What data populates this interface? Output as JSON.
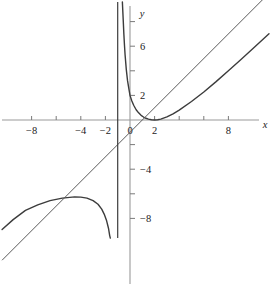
{
  "chart_data": {
    "type": "line",
    "title": "",
    "subtitle": "",
    "xlabel": "x",
    "ylabel": "y",
    "xlim": [
      -10.4,
      11.5
    ],
    "ylim": [
      -9.6,
      9.6
    ],
    "grid": false,
    "legend_position": "none",
    "x_ticks": [
      -10,
      -9,
      -8,
      -7,
      -6,
      -5,
      -4,
      -3,
      -2,
      -1,
      0,
      1,
      2,
      3,
      4,
      5,
      6,
      7,
      8,
      9,
      10
    ],
    "x_tick_labels": [
      {
        "value": -8,
        "label": "−8"
      },
      {
        "value": -4,
        "label": "−4"
      },
      {
        "value": -2,
        "label": "−2"
      },
      {
        "value": 0,
        "label": "0"
      },
      {
        "value": 2,
        "label": "2"
      },
      {
        "value": 8,
        "label": "8"
      }
    ],
    "x_major_ticks": [
      -8,
      -6,
      -4,
      -2,
      2,
      4,
      6,
      8
    ],
    "y_ticks": [
      -9,
      -8,
      -7,
      -6,
      -5,
      -4,
      -3,
      -2,
      -1,
      1,
      2,
      3,
      4,
      5,
      6,
      7,
      8
    ],
    "y_tick_labels": [
      {
        "value": 6,
        "label": "6"
      },
      {
        "value": 2,
        "label": "2"
      },
      {
        "value": -4,
        "label": "−4"
      },
      {
        "value": -8,
        "label": "−8"
      }
    ],
    "y_major_ticks": [
      2,
      4,
      6,
      8,
      -2,
      -4,
      -6,
      -8
    ],
    "series": [
      {
        "name": "curve",
        "kind": "rational-function",
        "description": "Rational curve with vertical asymptote at x = -1 and slant asymptote y = x - 1; right branch minimum near (2, 0), left branch maximum near (-4, -6.3)",
        "vertical_asymptote": -1,
        "slant_asymptote": {
          "slope": 1,
          "intercept": -1
        },
        "color": "#3c3c3c",
        "width": 1.4,
        "points_right_branch": [
          [
            -0.62,
            9.6
          ],
          [
            -0.55,
            8.1
          ],
          [
            -0.5,
            7.0
          ],
          [
            -0.45,
            6.1
          ],
          [
            -0.4,
            5.3
          ],
          [
            -0.3,
            4.1
          ],
          [
            -0.2,
            3.2
          ],
          [
            -0.1,
            2.6
          ],
          [
            0,
            2.0
          ],
          [
            0.15,
            1.55
          ],
          [
            0.3,
            1.2
          ],
          [
            0.5,
            0.83
          ],
          [
            0.7,
            0.58
          ],
          [
            0.9,
            0.38
          ],
          [
            1.1,
            0.24
          ],
          [
            1.3,
            0.14
          ],
          [
            1.5,
            0.07
          ],
          [
            1.75,
            0.02
          ],
          [
            2.0,
            0.0
          ],
          [
            2.25,
            0.02
          ],
          [
            2.5,
            0.07
          ],
          [
            3.0,
            0.25
          ],
          [
            3.5,
            0.5
          ],
          [
            4.0,
            0.8
          ],
          [
            5.0,
            1.5
          ],
          [
            6.0,
            2.28
          ],
          [
            7.0,
            3.12
          ],
          [
            8.0,
            4.0
          ],
          [
            9.0,
            4.9
          ],
          [
            10.0,
            5.81
          ],
          [
            11.3,
            7.02
          ]
        ],
        "points_left_branch": [
          [
            -10.4,
            -8.9
          ],
          [
            -9.5,
            -8.1
          ],
          [
            -8.5,
            -7.35
          ],
          [
            -7.5,
            -6.9
          ],
          [
            -6.5,
            -6.55
          ],
          [
            -5.5,
            -6.35
          ],
          [
            -4.5,
            -6.25
          ],
          [
            -4.0,
            -6.27
          ],
          [
            -3.5,
            -6.35
          ],
          [
            -3.0,
            -6.55
          ],
          [
            -2.6,
            -6.85
          ],
          [
            -2.3,
            -7.25
          ],
          [
            -2.1,
            -7.65
          ],
          [
            -1.9,
            -8.2
          ],
          [
            -1.75,
            -8.8
          ],
          [
            -1.65,
            -9.4
          ],
          [
            -1.6,
            -9.7
          ]
        ]
      },
      {
        "name": "asymptote-line",
        "kind": "line",
        "description": "Oblique (slant) asymptote y = x - 1",
        "slope": 1,
        "intercept": -1,
        "color": "#5a5a5a",
        "width": 1.0,
        "x_from": -10.4,
        "x_to": 11.5
      },
      {
        "name": "vertical-asymptote-line",
        "kind": "vertical-line",
        "description": "Vertical asymptote at x = -1",
        "x": -1,
        "color": "#3c3c3c",
        "width": 1.2,
        "y_from": -9.6,
        "y_to": 9.6
      }
    ],
    "axes": {
      "x_axis_color": "#9a9a9a",
      "y_axis_color": "#9a9a9a",
      "tick_color": "#7a7a7a",
      "label_color": "#1b1b1b"
    }
  },
  "figure": {
    "background": "#ffffff",
    "origin_px": {
      "x": 130,
      "y": 120
    },
    "scale_px_per_unit": {
      "x": 12.3,
      "y": 12.3
    }
  }
}
